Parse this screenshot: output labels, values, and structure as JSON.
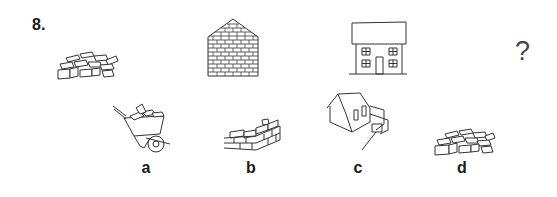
{
  "question": {
    "number": "8.",
    "sequence": [
      {
        "id": "pile-of-bricks",
        "icon": "brick-pile-icon"
      },
      {
        "id": "brick-wall",
        "icon": "brick-wall-icon"
      },
      {
        "id": "house",
        "icon": "house-icon"
      },
      {
        "id": "unknown",
        "symbol": "?"
      }
    ]
  },
  "options": [
    {
      "label": "a",
      "icon": "wheelbarrow-with-bricks-icon"
    },
    {
      "label": "b",
      "icon": "partial-brick-wall-icon"
    },
    {
      "label": "c",
      "icon": "house-under-construction-icon"
    },
    {
      "label": "d",
      "icon": "brick-pile-icon"
    }
  ],
  "colors": {
    "ink": "#1a1a1a",
    "background": "#ffffff"
  }
}
